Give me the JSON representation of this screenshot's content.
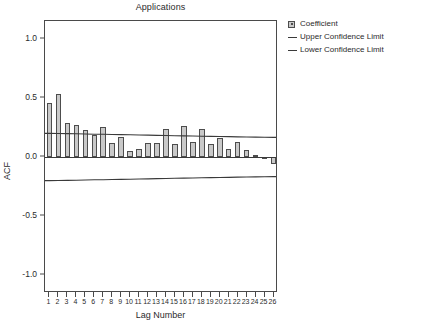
{
  "chart_data": {
    "type": "bar",
    "title": "Applications",
    "xlabel": "Lag Number",
    "ylabel": "ACF",
    "ylim": [
      -1.15,
      1.15
    ],
    "yticks": [
      1.0,
      0.5,
      0.0,
      -0.5,
      -1.0
    ],
    "ytick_labels": [
      "1.0",
      "0.5",
      "0.0",
      "-0.5",
      "-1.0"
    ],
    "grid": false,
    "legend_position": "right",
    "categories": [
      1,
      2,
      3,
      4,
      5,
      6,
      7,
      8,
      9,
      10,
      11,
      12,
      13,
      14,
      15,
      16,
      17,
      18,
      19,
      20,
      21,
      22,
      23,
      24,
      25,
      26
    ],
    "xtick_labels": [
      "1",
      "2",
      "3",
      "4",
      "5",
      "6",
      "7",
      "8",
      "9",
      "10",
      "11",
      "12",
      "13",
      "14",
      "15",
      "16",
      "17",
      "18",
      "19",
      "20",
      "21",
      "22",
      "23",
      "24",
      "25",
      "26"
    ],
    "series": [
      {
        "name": "Coefficient",
        "type": "bar",
        "values": [
          0.46,
          0.53,
          0.29,
          0.27,
          0.23,
          0.19,
          0.25,
          0.12,
          0.17,
          0.05,
          0.07,
          0.12,
          0.12,
          0.24,
          0.11,
          0.26,
          0.13,
          0.24,
          0.11,
          0.16,
          0.07,
          0.13,
          0.06,
          0.02,
          0.0,
          -0.06
        ]
      },
      {
        "name": "Upper Confidence Limit",
        "type": "line",
        "values": [
          0.2,
          0.199,
          0.198,
          0.196,
          0.195,
          0.193,
          0.192,
          0.19,
          0.189,
          0.188,
          0.186,
          0.185,
          0.183,
          0.182,
          0.18,
          0.179,
          0.177,
          0.176,
          0.174,
          0.173,
          0.172,
          0.17,
          0.169,
          0.168,
          0.167,
          0.166
        ]
      },
      {
        "name": "Lower Confidence Limit",
        "type": "line",
        "values": [
          -0.2,
          -0.199,
          -0.198,
          -0.196,
          -0.195,
          -0.193,
          -0.192,
          -0.19,
          -0.189,
          -0.188,
          -0.186,
          -0.185,
          -0.183,
          -0.182,
          -0.18,
          -0.179,
          -0.177,
          -0.176,
          -0.174,
          -0.173,
          -0.172,
          -0.17,
          -0.169,
          -0.168,
          -0.167,
          -0.166
        ]
      }
    ]
  },
  "legend": {
    "items": [
      {
        "label": "Coefficient",
        "marker": "box"
      },
      {
        "label": "Upper Confidence Limit",
        "marker": "line"
      },
      {
        "label": "Lower Confidence Limit",
        "marker": "line"
      }
    ]
  },
  "colors": {
    "bar_fill": "#c9c9c9",
    "bar_stroke": "#4d4d4d",
    "line": "#3a3a3a",
    "axis": "#4a4a4a",
    "text": "#2b2b2b",
    "background": "#ffffff"
  }
}
